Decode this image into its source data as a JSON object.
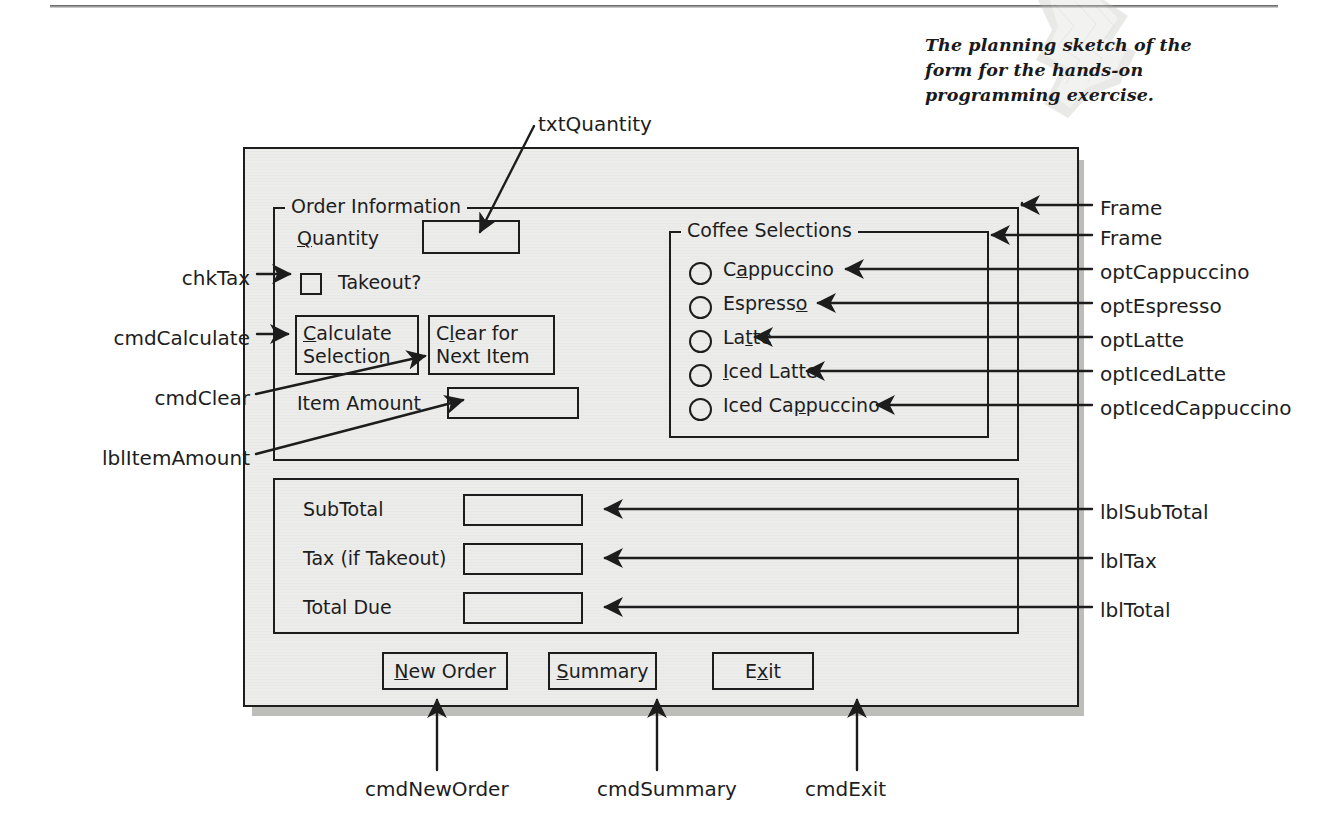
{
  "caption": "The planning sketch of the form for the hands-on programming exercise.",
  "form": {
    "order_frame": {
      "legend": "Order Information",
      "quantity_label_pre": "",
      "quantity_label": "Quantity",
      "quantity_accel": "Q",
      "quantity_value": "",
      "takeout_label": "Takeout?",
      "takeout_checked": false,
      "calculate_line1": "Calculate",
      "calculate_line1_accel": "C",
      "calculate_line2": "Selection",
      "clear_line1": "Clear for",
      "clear_line1_accel": "l",
      "clear_line2": "Next Item",
      "item_amount_label": "Item Amount",
      "item_amount_value": ""
    },
    "coffee_frame": {
      "legend": "Coffee Selections",
      "options": [
        {
          "label": "Cappuccino",
          "accel": "a",
          "selected": false
        },
        {
          "label": "Espresso",
          "accel": "o",
          "selected": false
        },
        {
          "label": "Latte",
          "accel": "t",
          "selected": false
        },
        {
          "label": "Iced Latte",
          "accel": "I",
          "selected": false
        },
        {
          "label": "Iced Cappuccino",
          "accel": "p",
          "selected": false
        }
      ]
    },
    "totals_frame": {
      "rows": [
        {
          "label": "SubTotal",
          "value": ""
        },
        {
          "label": "Tax (if Takeout)",
          "value": ""
        },
        {
          "label": "Total Due",
          "value": ""
        }
      ]
    },
    "buttons": [
      {
        "label": "New Order",
        "accel": "N"
      },
      {
        "label": "Summary",
        "accel": "S"
      },
      {
        "label": "Exit",
        "accel": "x"
      }
    ]
  },
  "callouts": {
    "top": [
      {
        "name": "txtQuantity"
      }
    ],
    "left": [
      {
        "name": "chkTax"
      },
      {
        "name": "cmdCalculate"
      },
      {
        "name": "cmdClear"
      },
      {
        "name": "lblItemAmount"
      }
    ],
    "right": [
      {
        "name": "Frame"
      },
      {
        "name": "Frame"
      },
      {
        "name": "optCappuccino"
      },
      {
        "name": "optEspresso"
      },
      {
        "name": "optLatte"
      },
      {
        "name": "optIcedLatte"
      },
      {
        "name": "optIcedCappuccino"
      },
      {
        "name": "lblSubTotal"
      },
      {
        "name": "lblTax"
      },
      {
        "name": "lblTotal"
      }
    ],
    "bottom": [
      {
        "name": "cmdNewOrder"
      },
      {
        "name": "cmdSummary"
      },
      {
        "name": "cmdExit"
      }
    ]
  },
  "colors": {
    "ink": "#1d1d1d",
    "form_fill": "#ececeb",
    "form_shadow": "#bdbdba",
    "page": "#ffffff"
  }
}
